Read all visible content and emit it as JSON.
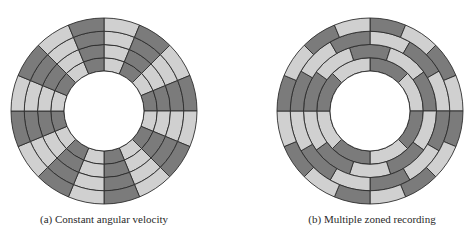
{
  "colors": {
    "dark": "#7b7b7b",
    "light": "#d0d0d0",
    "stroke": "#2e2e2e",
    "background": "#ffffff"
  },
  "panels": [
    {
      "id": "a",
      "caption": "(a) Constant angular velocity",
      "disk": {
        "cx": 104,
        "cy": 111,
        "ring_radii": [
          40,
          53.25,
          66.5,
          79.75,
          93
        ],
        "rings": [
          {
            "sectors": 16,
            "offset_deg": 0,
            "first_color": "light"
          },
          {
            "sectors": 16,
            "offset_deg": 0,
            "first_color": "light"
          },
          {
            "sectors": 16,
            "offset_deg": 0,
            "first_color": "light"
          },
          {
            "sectors": 16,
            "offset_deg": 0,
            "first_color": "light"
          }
        ]
      }
    },
    {
      "id": "b",
      "caption": "(b) Multiple zoned recording",
      "disk": {
        "cx": 370,
        "cy": 111,
        "ring_radii": [
          40,
          53.25,
          66.5,
          79.75,
          93
        ],
        "rings": [
          {
            "sectors": 8,
            "offset_deg": 0,
            "first_color": "dark"
          },
          {
            "sectors": 10,
            "offset_deg": -18,
            "first_color": "dark"
          },
          {
            "sectors": 12,
            "offset_deg": 0,
            "first_color": "light"
          },
          {
            "sectors": 16,
            "offset_deg": 0,
            "first_color": "dark"
          }
        ]
      }
    }
  ]
}
